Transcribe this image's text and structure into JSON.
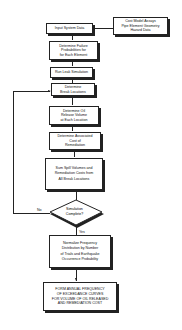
{
  "flowchart": {
    "nodes": {
      "input": "Input System Data",
      "cost_model": "Cost Model Assays\nPipe Element Geometry\nHazard Data",
      "failure": "Determine Failure\nProbabilities for\nfor Each Element",
      "leak": "Run Leak Simulation",
      "break": "Determine\nBreak Locations",
      "oil": "Determine Oil\nRelease Volume\nat Each Location",
      "cost": "Determine Associated\nCost of\nRemediation",
      "sum": "Sum Spill Volumes and\nRemediation Costs from\nAll Break Locations",
      "decision": "Simulation\nComplete?",
      "normalize": "Normalize Frequency\nDistribution by Number\nof Trials and Earthquake\nOccurrence Probability",
      "form": "FORM ANNUAL FREQUENCY\nOF EXCEEDANCE CURVES\nFOR VOLUME OF OIL RELEASED\nAND REMEDIATION COST"
    },
    "labels": {
      "no": "No",
      "yes": "Yes"
    }
  }
}
